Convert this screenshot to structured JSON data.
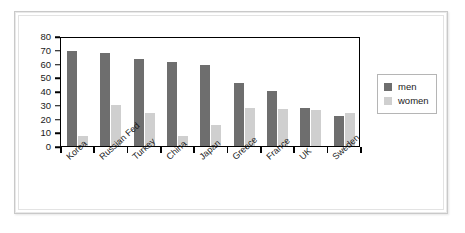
{
  "chart_data": {
    "type": "bar",
    "title": "",
    "subtitle": "",
    "xlabel": "",
    "ylabel": "",
    "ylim": [
      0,
      80
    ],
    "ytick_step": 10,
    "yticks": [
      "0",
      "10",
      "20",
      "30",
      "40",
      "50",
      "60",
      "70",
      "80"
    ],
    "grid": false,
    "legend_position": "right",
    "categories": [
      "Korea",
      "Russian Fed",
      "Turkey",
      "China",
      "Japan",
      "Greece",
      "France",
      "UK",
      "Sweden"
    ],
    "series": [
      {
        "name": "men",
        "color": "#6e6e6e",
        "values": [
          69,
          68,
          63,
          61,
          59,
          46,
          40,
          28,
          22
        ]
      },
      {
        "name": "women",
        "color": "#cfcfcf",
        "values": [
          7,
          30,
          24,
          7,
          15,
          28,
          27,
          26,
          24
        ]
      }
    ]
  },
  "legend": {
    "entries": [
      {
        "label": "men"
      },
      {
        "label": "women"
      }
    ]
  }
}
